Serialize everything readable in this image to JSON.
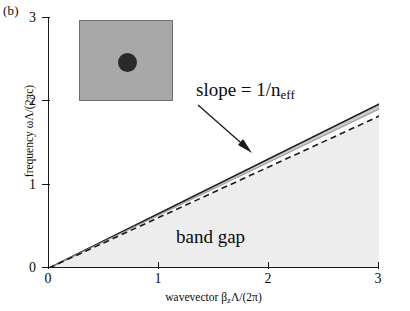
{
  "panel": {
    "label": "(b)"
  },
  "axes": {
    "x": {
      "title_text": "wavevector  β",
      "title_sub": "z",
      "title_tail": "Λ/(2π)",
      "ticks": [
        "0",
        "1",
        "2",
        "3"
      ],
      "tick_values": [
        0,
        1,
        2,
        3
      ],
      "range": [
        0,
        3
      ]
    },
    "y": {
      "title": "frequency ωΛ/(2πc)",
      "ticks": [
        "0",
        "1",
        "2",
        "3"
      ],
      "tick_values": [
        0,
        1,
        2,
        3
      ],
      "range": [
        0,
        3
      ]
    }
  },
  "annotations": {
    "slope": {
      "text": "slope = 1/n",
      "sub": "eff"
    },
    "band_gap": {
      "text": "band gap"
    }
  },
  "inset": {
    "name": "fiber-cross-section",
    "background_color": "#a8a8a8",
    "core_color": "#2a2a2a",
    "border_color": "#6f6f6f"
  },
  "colors": {
    "axis": "#1a1a1a",
    "solid_line": "#1a1a1a",
    "dashed_line": "#1a1a1a",
    "band_fill": "#c9c9c9",
    "band_gap_fill": "#ededed",
    "background": "#ffffff"
  },
  "chart_data": {
    "type": "line",
    "title": "",
    "xlabel": "wavevector βzΛ/(2π)",
    "ylabel": "frequency ωΛ/(2πc)",
    "xlim": [
      0,
      3
    ],
    "ylim": [
      0,
      3
    ],
    "grid": false,
    "legend": null,
    "series": [
      {
        "name": "light line (solid, upper band edge)",
        "style": "solid",
        "color": "#1a1a1a",
        "slope": 0.655,
        "x": [
          0,
          3
        ],
        "y": [
          0,
          1.965
        ]
      },
      {
        "name": "band edge (gray band lower bound)",
        "style": "solid-thin",
        "color": "#9a9a9a",
        "slope": 0.635,
        "x": [
          0,
          3
        ],
        "y": [
          0,
          1.905
        ]
      },
      {
        "name": "effective index line (dashed, slope = 1/n_eff)",
        "style": "dashed",
        "color": "#1a1a1a",
        "slope": 0.607,
        "x": [
          0,
          3
        ],
        "y": [
          0,
          1.82
        ]
      }
    ],
    "regions": [
      {
        "name": "narrow allowed band",
        "fill": "#c9c9c9",
        "between": [
          "band edge (gray band lower bound)",
          "light line (solid, upper band edge)"
        ]
      },
      {
        "name": "band gap",
        "fill": "#ededed",
        "label": "band gap",
        "below": "effective index line (dashed, slope = 1/n_eff)"
      }
    ]
  }
}
